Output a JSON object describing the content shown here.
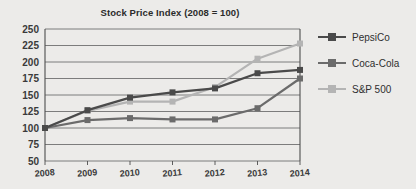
{
  "chart_data": {
    "type": "line",
    "title": "Stock Price Index (2008 = 100)",
    "xlabel": "",
    "ylabel": "",
    "x": [
      "2008",
      "2009",
      "2010",
      "2011",
      "2012",
      "2013",
      "2014"
    ],
    "categories": [
      "2008",
      "2009",
      "2010",
      "2011",
      "2012",
      "2013",
      "2014"
    ],
    "ylim": [
      50,
      250
    ],
    "ytick_step": 25,
    "yticks": [
      "250",
      "225",
      "200",
      "175",
      "150",
      "125",
      "100",
      "75",
      "50"
    ],
    "grid": "horizontal",
    "legend_position": "right",
    "marker": "square",
    "series": [
      {
        "name": "PepsiCo",
        "color": "#4a4a4a",
        "values": [
          100,
          127,
          146,
          154,
          160,
          183,
          188
        ]
      },
      {
        "name": "Coca-Cola",
        "color": "#6b6b6b",
        "values": [
          100,
          112,
          115,
          113,
          113,
          130,
          175
        ]
      },
      {
        "name": "S&P 500",
        "color": "#b4b4b4",
        "values": [
          100,
          126,
          140,
          140,
          162,
          205,
          228
        ]
      }
    ]
  },
  "colors": {
    "background": "#ecebe9",
    "plot_background": "#e8e7e5",
    "grid": "#6f6f6f",
    "axis": "#4d4d4d",
    "text": "#2f2f2f",
    "pepsico": "#4a4a4a",
    "cocacola": "#6b6b6b",
    "sp500": "#b4b4b4"
  }
}
